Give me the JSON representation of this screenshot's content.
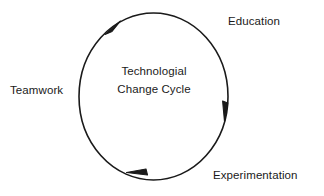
{
  "diagram": {
    "kind": "cycle-diagram",
    "background_color": "#ffffff",
    "stroke_color": "#1a1a1a",
    "text_color": "#1a1a1a",
    "center_caption": {
      "line1": "Technologial",
      "line2": "Change Cycle"
    },
    "labels": [
      {
        "id": "education",
        "text": "Education",
        "position": "top-right"
      },
      {
        "id": "teamwork",
        "text": "Teamwork",
        "position": "left"
      },
      {
        "id": "experimentation",
        "text": "Experimentation",
        "position": "bottom-right"
      }
    ],
    "flow": {
      "direction": "clockwise",
      "arrow_count": 3,
      "arrow_positions": [
        "top-left",
        "right",
        "bottom"
      ]
    },
    "ellipse": {
      "center_x": 153.5,
      "center_y": 96.5,
      "radius_x": 74.5,
      "radius_y": 83.5,
      "stroke_width": 1.6
    }
  }
}
